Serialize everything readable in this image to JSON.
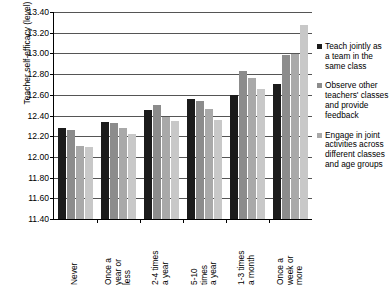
{
  "chart_data": {
    "type": "bar",
    "title": "",
    "xlabel": "",
    "ylabel": "Teacher self-efficacy (level)",
    "ylim": [
      11.4,
      13.4
    ],
    "ytick_step": 0.2,
    "ytick_labels": [
      "13.40",
      "13.20",
      "13.00",
      "12.80",
      "12.60",
      "12.40",
      "12.20",
      "12.00",
      "11.80",
      "11.60",
      "11.40"
    ],
    "grid": true,
    "legend_position": "right",
    "categories": [
      "Never",
      "Once a year or less",
      "2-4 times a year",
      "5-10 times a year",
      "1-3 times a month",
      "Once a week or more"
    ],
    "category_lines": [
      "Never",
      "Once a\nyear or\nless",
      "2-4 times\na year",
      "5-10\ntimes\na year",
      "1-3 times\na month",
      "Once a\nweek or\nmore"
    ],
    "series": [
      {
        "name": "Teach jointly as a team in the same class",
        "color": "#1b1b1b",
        "values": [
          12.28,
          12.34,
          12.45,
          12.56,
          12.6,
          12.7
        ]
      },
      {
        "name": "Observe other teachers' classes and provide feedback",
        "color": "#8c8c8c",
        "values": [
          12.26,
          12.33,
          12.5,
          12.54,
          12.83,
          12.98
        ]
      },
      {
        "name": "Engage in joint activities across different classes and age groups",
        "color": "#a9a9a9",
        "values": [
          12.11,
          12.28,
          12.39,
          12.46,
          12.76,
          12.99
        ]
      },
      {
        "name": "",
        "color": "#c8c8c8",
        "values": [
          12.1,
          12.22,
          12.35,
          12.36,
          12.66,
          13.27
        ]
      }
    ]
  },
  "legend": {
    "items": [
      {
        "label": "Teach jointly as\na team in the\nsame class",
        "color": "#1b1b1b"
      },
      {
        "label": "Observe other\nteachers' classes\nand provide\nfeedback",
        "color": "#8c8c8c"
      },
      {
        "label": "Engage in joint\nactivities across\ndifferent classes\nand age groups",
        "color": "#a9a9a9"
      }
    ]
  }
}
